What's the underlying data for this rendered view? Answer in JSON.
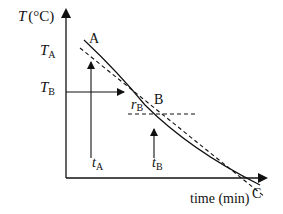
{
  "diagram": {
    "y_axis": {
      "symbol": "T",
      "unit": "(°C)"
    },
    "x_axis": {
      "label": "time (min)"
    },
    "points": [
      {
        "id": "A",
        "label": "A"
      },
      {
        "id": "B",
        "label": "B"
      },
      {
        "id": "C",
        "label": "C"
      }
    ],
    "temperature_labels": {
      "TA": {
        "main": "T",
        "sub": "A"
      },
      "TB": {
        "main": "T",
        "sub": "B"
      }
    },
    "time_labels": {
      "tA": {
        "main": "t",
        "sub": "A"
      },
      "tB": {
        "main": "t",
        "sub": "B"
      }
    },
    "rate_label": {
      "main": "r",
      "sub": "B"
    },
    "colors": {
      "line": "#111111",
      "background": "#ffffff"
    }
  }
}
